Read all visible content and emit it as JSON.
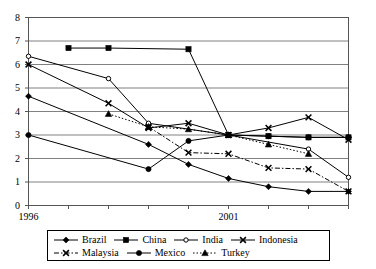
{
  "chart_data": {
    "type": "line",
    "title": "",
    "subtitle": "",
    "xlabel": "",
    "ylabel": "",
    "xlim": [
      1996,
      2004
    ],
    "ylim": [
      0,
      8
    ],
    "yticks": [
      0,
      1,
      2,
      3,
      4,
      5,
      6,
      7,
      8
    ],
    "grid": "horizontal",
    "x": [
      1996,
      1997,
      1998,
      1999,
      2000,
      2001,
      2002,
      2003,
      2004
    ],
    "xtick_labels": [
      "1996",
      "",
      "",
      "",
      "",
      "2001",
      "",
      "",
      ""
    ],
    "xticks_visible_labels": [
      "1996",
      "2001"
    ],
    "legend_position": "below",
    "legend_columns": 4,
    "series": [
      {
        "name": "Brazil",
        "marker": "diamond",
        "line_style": "solid",
        "color": "#000000",
        "x": [
          1996,
          1999,
          2000,
          2001,
          2002,
          2003,
          2004
        ],
        "values": [
          4.65,
          2.6,
          1.75,
          1.15,
          0.8,
          0.6,
          0.6
        ]
      },
      {
        "name": "China",
        "marker": "square",
        "line_style": "solid",
        "color": "#000000",
        "x": [
          1997,
          1998,
          2000,
          2001,
          2002,
          2003,
          2004
        ],
        "values": [
          6.7,
          6.7,
          6.65,
          3.0,
          2.95,
          2.9,
          2.9
        ]
      },
      {
        "name": "India",
        "marker": "circle-open",
        "line_style": "solid",
        "color": "#000000",
        "x": [
          1996,
          1998,
          1999,
          2001,
          2003,
          2004
        ],
        "values": [
          6.35,
          5.4,
          3.5,
          3.0,
          2.4,
          1.2
        ]
      },
      {
        "name": "Indonesia",
        "marker": "x",
        "line_style": "solid",
        "color": "#000000",
        "x": [
          1996,
          1998,
          1999,
          2000,
          2001,
          2002,
          2003,
          2004
        ],
        "values": [
          6.0,
          4.35,
          3.3,
          3.5,
          3.0,
          3.3,
          3.75,
          2.8
        ]
      },
      {
        "name": "Malaysia",
        "marker": "x",
        "line_style": "dash-dot",
        "color": "#000000",
        "x": [
          1999,
          2000,
          2001,
          2002,
          2003,
          2004
        ],
        "values": [
          3.35,
          2.25,
          2.2,
          1.6,
          1.55,
          0.6
        ]
      },
      {
        "name": "Mexico",
        "marker": "circle",
        "line_style": "solid",
        "color": "#000000",
        "x": [
          1996,
          1999,
          2000,
          2001,
          2002,
          2003,
          2004
        ],
        "values": [
          3.0,
          1.55,
          2.75,
          3.0,
          2.95,
          2.9,
          2.9
        ]
      },
      {
        "name": "Turkey",
        "marker": "triangle",
        "line_style": "dotted",
        "color": "#000000",
        "x": [
          1998,
          1999,
          2000,
          2001,
          2002,
          2003
        ],
        "values": [
          3.9,
          3.35,
          3.25,
          3.0,
          2.6,
          2.2
        ]
      }
    ]
  },
  "axis": {
    "y_tick_labels": [
      "8",
      "7",
      "6",
      "5",
      "4",
      "3",
      "2",
      "1",
      "0"
    ],
    "x_tick_labels": [
      "1996",
      "2001"
    ]
  },
  "legend": {
    "row1": [
      "Brazil",
      "China",
      "India",
      "Indonesia"
    ],
    "row2": [
      "Malaysia",
      "Mexico",
      "Turkey"
    ]
  }
}
